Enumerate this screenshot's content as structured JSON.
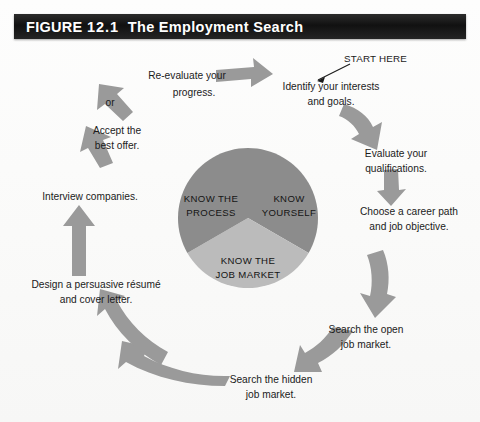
{
  "figure": {
    "label": "FIGURE",
    "number": "12.1",
    "title": "The Employment Search"
  },
  "colors": {
    "title_bar": "#111111",
    "title_text": "#ffffff",
    "wedge_dark": "#8c8c8c",
    "wedge_light": "#b9b9b9",
    "arrow": "#9a9a9a",
    "text": "#1b1b1b",
    "page_background": "#fbfbfa"
  },
  "center_wheel": {
    "name": "know-wheel",
    "wedges": [
      {
        "id": "know-yourself",
        "label_lines": [
          "KNOW",
          "YOURSELF"
        ],
        "shade": "dark"
      },
      {
        "id": "know-the-job-market",
        "label_lines": [
          "KNOW THE",
          "JOB MARKET"
        ],
        "shade": "light"
      },
      {
        "id": "know-the-process",
        "label_lines": [
          "KNOW THE",
          "PROCESS"
        ],
        "shade": "dark"
      }
    ]
  },
  "start_marker": {
    "label": "START HERE"
  },
  "steps": [
    {
      "id": "identify-interests",
      "lines": [
        "Identify your interests",
        "and goals."
      ]
    },
    {
      "id": "evaluate-qualifications",
      "lines": [
        "Evaluate your",
        "qualifications."
      ]
    },
    {
      "id": "choose-career-path",
      "lines": [
        "Choose a career path",
        "and job objective."
      ]
    },
    {
      "id": "search-open-market",
      "lines": [
        "Search the open",
        "job market."
      ]
    },
    {
      "id": "search-hidden-market",
      "lines": [
        "Search the hidden",
        "job market."
      ]
    },
    {
      "id": "design-resume",
      "lines": [
        "Design a persuasive résumé",
        "and cover letter."
      ]
    },
    {
      "id": "interview-companies",
      "lines": [
        "Interview companies."
      ]
    },
    {
      "id": "accept-best-offer",
      "lines": [
        "Accept the",
        "best offer."
      ]
    },
    {
      "id": "re-evaluate-progress",
      "lines": [
        "Re-evaluate your",
        "progress."
      ]
    }
  ],
  "branch": {
    "label": "or"
  }
}
